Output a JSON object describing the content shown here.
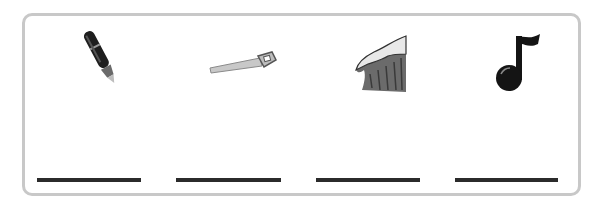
{
  "worksheet": {
    "items": [
      {
        "icon": "pen-icon",
        "answer": ""
      },
      {
        "icon": "saw-icon",
        "answer": ""
      },
      {
        "icon": "wave-icon",
        "answer": ""
      },
      {
        "icon": "music-note-icon",
        "answer": ""
      }
    ],
    "colors": {
      "border": "#c8c8c8",
      "line": "#2b2b2b"
    }
  }
}
